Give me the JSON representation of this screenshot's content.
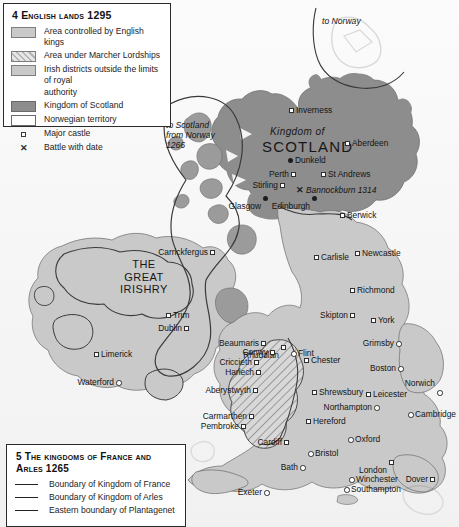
{
  "legend_top": {
    "title": "4 English lands 1295",
    "rows": [
      {
        "swatch": "english",
        "label": "Area controlled by English kings"
      },
      {
        "swatch": "marcher",
        "label": "Area under Marcher Lordships"
      },
      {
        "swatch": "irish",
        "label": "Irish districts outside the limits of royal",
        "cont": "authority"
      },
      {
        "swatch": "scotland",
        "label": "Kingdom of Scotland"
      },
      {
        "swatch": "norwegian",
        "label": "Norwegian territory"
      },
      {
        "swatch": "castle",
        "label": "Major castle"
      },
      {
        "swatch": "battle",
        "label": "Battle with date"
      }
    ]
  },
  "legend_bottom": {
    "title": "5 The kingdoms of France and Arles 1265",
    "rows": [
      {
        "label": "Boundary of Kingdom of France"
      },
      {
        "label": "Boundary of Kingdom of Arles"
      },
      {
        "label": "Eastern boundary of Plantagenet"
      }
    ]
  },
  "regions": {
    "scotland_sub": "Kingdom of",
    "scotland": "SCOTLAND",
    "irishry": "THE\nGREAT\nIRISHRY"
  },
  "annotations": {
    "to_norway": "to Norway",
    "to_scotland": "to Scotland\nfrom Norway\n1266"
  },
  "battles": [
    {
      "name": "Bannockburn 1314",
      "x": 296,
      "y": 186
    }
  ],
  "places": [
    {
      "name": "Inverness",
      "sym": "castle",
      "x": 289,
      "y": 108,
      "side": "left"
    },
    {
      "name": "Aberdeen",
      "sym": "castle",
      "x": 345,
      "y": 141,
      "side": "left"
    },
    {
      "name": "Dunkeld",
      "sym": "dot",
      "x": 288,
      "y": 158,
      "side": "left"
    },
    {
      "name": "Perth",
      "sym": "castle",
      "x": 291,
      "y": 172,
      "side": "right"
    },
    {
      "name": "St Andrews",
      "sym": "castle",
      "x": 321,
      "y": 172,
      "side": "left"
    },
    {
      "name": "Stirling",
      "sym": "castle",
      "x": 280,
      "y": 183,
      "side": "right"
    },
    {
      "name": "Glasgow",
      "sym": "dot",
      "x": 263,
      "y": 196,
      "side": "below"
    },
    {
      "name": "Edinburgh",
      "sym": "dot",
      "x": 312,
      "y": 196,
      "side": "below"
    },
    {
      "name": "Berwick",
      "sym": "castle",
      "x": 340,
      "y": 213,
      "side": "left"
    },
    {
      "name": "Carrickfergus",
      "sym": "castle",
      "x": 210,
      "y": 250,
      "side": "right"
    },
    {
      "name": "Carlisle",
      "sym": "castle",
      "x": 314,
      "y": 255,
      "side": "left"
    },
    {
      "name": "Newcastle",
      "sym": "castle",
      "x": 355,
      "y": 251,
      "side": "left"
    },
    {
      "name": "Richmond",
      "sym": "castle",
      "x": 350,
      "y": 288,
      "side": "left"
    },
    {
      "name": "Trim",
      "sym": "castle",
      "x": 166,
      "y": 313,
      "side": "left"
    },
    {
      "name": "Skipton",
      "sym": "castle",
      "x": 350,
      "y": 313,
      "side": "right"
    },
    {
      "name": "York",
      "sym": "castle",
      "x": 371,
      "y": 318,
      "side": "left"
    },
    {
      "name": "Dublin",
      "sym": "castle",
      "x": 184,
      "y": 326,
      "side": "right"
    },
    {
      "name": "Beaumaris",
      "sym": "castle",
      "x": 261,
      "y": 341,
      "side": "right"
    },
    {
      "name": "Rhuddlan",
      "sym": "castle",
      "x": 281,
      "y": 345,
      "side": "below"
    },
    {
      "name": "Grimsby",
      "sym": "town",
      "x": 396,
      "y": 341,
      "side": "right"
    },
    {
      "name": "Conwy",
      "sym": "castle",
      "x": 270,
      "y": 350,
      "side": "right"
    },
    {
      "name": "Flint",
      "sym": "town",
      "x": 291,
      "y": 351,
      "side": "left"
    },
    {
      "name": "Chester",
      "sym": "castle",
      "x": 304,
      "y": 358,
      "side": "left"
    },
    {
      "name": "Limerick",
      "sym": "castle",
      "x": 94,
      "y": 352,
      "side": "left"
    },
    {
      "name": "Criccieth",
      "sym": "castle",
      "x": 254,
      "y": 360,
      "side": "right"
    },
    {
      "name": "Harlech",
      "sym": "castle",
      "x": 256,
      "y": 370,
      "side": "right"
    },
    {
      "name": "Boston",
      "sym": "town",
      "x": 398,
      "y": 366,
      "side": "right"
    },
    {
      "name": "Norwich",
      "sym": "town",
      "x": 437,
      "y": 390,
      "side": "above"
    },
    {
      "name": "Aberystwyth",
      "sym": "castle",
      "x": 253,
      "y": 388,
      "side": "right"
    },
    {
      "name": "Shrewsbury",
      "sym": "castle",
      "x": 312,
      "y": 390,
      "side": "left"
    },
    {
      "name": "Leicester",
      "sym": "castle",
      "x": 366,
      "y": 392,
      "side": "left"
    },
    {
      "name": "Waterford",
      "sym": "town",
      "x": 116,
      "y": 380,
      "side": "right"
    },
    {
      "name": "Northampton",
      "sym": "town",
      "x": 374,
      "y": 405,
      "side": "right"
    },
    {
      "name": "Cambridge",
      "sym": "town",
      "x": 408,
      "y": 412,
      "side": "left"
    },
    {
      "name": "Carmarthen",
      "sym": "castle",
      "x": 249,
      "y": 414,
      "side": "right"
    },
    {
      "name": "Hereford",
      "sym": "castle",
      "x": 306,
      "y": 419,
      "side": "left"
    },
    {
      "name": "Pembroke",
      "sym": "castle",
      "x": 241,
      "y": 424,
      "side": "right"
    },
    {
      "name": "Cardiff",
      "sym": "castle",
      "x": 284,
      "y": 440,
      "side": "right"
    },
    {
      "name": "Oxford",
      "sym": "town",
      "x": 348,
      "y": 437,
      "side": "left"
    },
    {
      "name": "Bristol",
      "sym": "town",
      "x": 308,
      "y": 451,
      "side": "left"
    },
    {
      "name": "London",
      "sym": "castle",
      "x": 389,
      "y": 460,
      "side": "below"
    },
    {
      "name": "Bath",
      "sym": "town",
      "x": 300,
      "y": 465,
      "side": "right"
    },
    {
      "name": "Winchester",
      "sym": "town",
      "x": 349,
      "y": 477,
      "side": "left"
    },
    {
      "name": "Dover",
      "sym": "castle",
      "x": 430,
      "y": 477,
      "side": "right"
    },
    {
      "name": "Southampton",
      "sym": "town",
      "x": 344,
      "y": 487,
      "side": "left"
    },
    {
      "name": "Exeter",
      "sym": "town",
      "x": 264,
      "y": 490,
      "side": "right"
    }
  ],
  "colors": {
    "england": "#c9c9c9",
    "scotland": "#8d8d8d",
    "irish": "#c9c9c9",
    "sea": "#f5f5f5",
    "outline": "#6a6a6a",
    "text": "#141414"
  }
}
